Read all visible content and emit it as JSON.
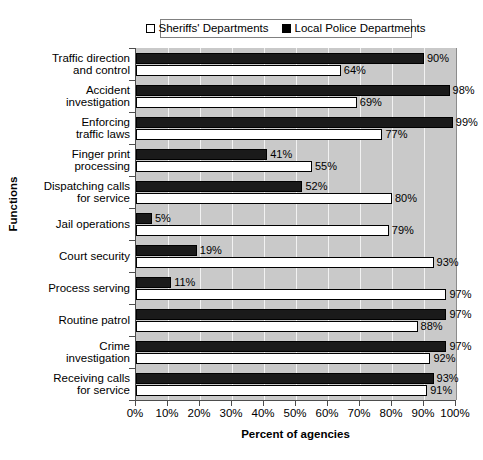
{
  "chart_data": {
    "type": "bar",
    "orientation": "horizontal",
    "title": "",
    "xlabel": "Percent of agencies",
    "ylabel": "Functions",
    "xlim": [
      0,
      100
    ],
    "xticks": [
      "0%",
      "10%",
      "20%",
      "30%",
      "40%",
      "50%",
      "60%",
      "70%",
      "80%",
      "90%",
      "100%"
    ],
    "grid": true,
    "legend_position": "top",
    "categories": [
      "Traffic direction and control",
      "Accident investigation",
      "Enforcing traffic laws",
      "Finger print processing",
      "Dispatching calls for service",
      "Jail operations",
      "Court security",
      "Process serving",
      "Routine patrol",
      "Crime investigation",
      "Receiving calls for service"
    ],
    "series": [
      {
        "name": "Local Police Departments",
        "color": "#1a1a1a",
        "values": [
          90,
          98,
          99,
          41,
          52,
          5,
          19,
          11,
          97,
          97,
          93
        ],
        "labels": [
          "90%",
          "98%",
          "99%",
          "41%",
          "52%",
          "5%",
          "19%",
          "11%",
          "97%",
          "97%",
          "93%"
        ]
      },
      {
        "name": "Sheriffs' Departments",
        "color": "#ffffff",
        "values": [
          64,
          69,
          77,
          55,
          80,
          79,
          93,
          97,
          88,
          92,
          91
        ],
        "labels": [
          "64%",
          "69%",
          "77%",
          "55%",
          "80%",
          "79%",
          "93%",
          "97%",
          "88%",
          "92%",
          "91%"
        ]
      }
    ]
  },
  "legend": {
    "entries": [
      {
        "label": "Sheriffs' Departments",
        "swatch": "white"
      },
      {
        "label": "Local Police Departments",
        "swatch": "black"
      }
    ]
  },
  "category_lines": [
    [
      "Traffic direction",
      "and control"
    ],
    [
      "Accident",
      "investigation"
    ],
    [
      "Enforcing",
      "traffic laws"
    ],
    [
      "Finger print",
      "processing"
    ],
    [
      "Dispatching calls",
      "for service"
    ],
    [
      "Jail operations"
    ],
    [
      "Court security"
    ],
    [
      "Process serving"
    ],
    [
      "Routine patrol"
    ],
    [
      "Crime",
      "investigation"
    ],
    [
      "Receiving calls",
      "for service"
    ]
  ],
  "axes": {
    "x_title": "Percent of agencies",
    "y_title": "Functions"
  }
}
